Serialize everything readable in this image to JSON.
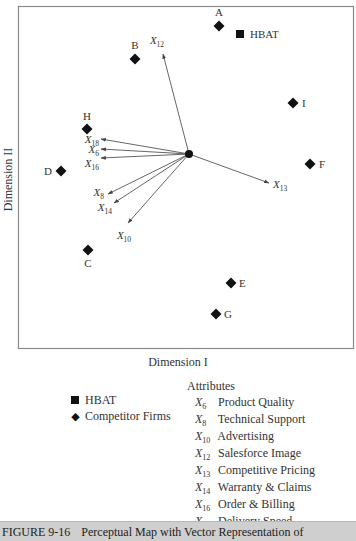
{
  "chart_data": {
    "type": "scatter",
    "title": "Perceptual Map with Vector Representation of",
    "figure_number": "FIGURE 9-16",
    "xlabel": "Dimension I",
    "ylabel": "Dimension II",
    "grid": false,
    "legend_position": "bottom",
    "origin": [
      0,
      0
    ],
    "units": "relative plot units (pixels from vector origin, y up)",
    "firms": [
      {
        "label": "HBAT",
        "marker": "square",
        "x": 51,
        "y": 120
      },
      {
        "label": "A",
        "marker": "diamond",
        "x": 30,
        "y": 128
      },
      {
        "label": "B",
        "marker": "diamond",
        "x": -54,
        "y": 95
      },
      {
        "label": "C",
        "marker": "diamond",
        "x": -101,
        "y": -96
      },
      {
        "label": "D",
        "marker": "diamond",
        "x": -128,
        "y": -17
      },
      {
        "label": "E",
        "marker": "diamond",
        "x": 42,
        "y": -129
      },
      {
        "label": "F",
        "marker": "diamond",
        "x": 121,
        "y": -10
      },
      {
        "label": "G",
        "marker": "diamond",
        "x": 27,
        "y": -160
      },
      {
        "label": "H",
        "marker": "diamond",
        "x": -102,
        "y": 25
      },
      {
        "label": "I",
        "marker": "diamond",
        "x": 104,
        "y": 51
      }
    ],
    "vectors": [
      {
        "code": "12",
        "name": "Salesforce Image",
        "x": -26,
        "y": 100
      },
      {
        "code": "18",
        "name": "Delivery Speed",
        "x": -88,
        "y": 15
      },
      {
        "code": "6",
        "name": "Product Quality",
        "x": -88,
        "y": 5
      },
      {
        "code": "16",
        "name": "Order & Billing",
        "x": -88,
        "y": -4
      },
      {
        "code": "8",
        "name": "Technical Support",
        "x": -81,
        "y": -40
      },
      {
        "code": "14",
        "name": "Warranty & Claims",
        "x": -75,
        "y": -49
      },
      {
        "code": "10",
        "name": "Advertising",
        "x": -61,
        "y": -69
      },
      {
        "code": "13",
        "name": "Competitive Pricing",
        "x": 80,
        "y": -29
      }
    ]
  },
  "axes": {
    "xlabel": "Dimension I",
    "ylabel": "Dimension II"
  },
  "legend": {
    "firms": [
      {
        "marker": "square",
        "label": "HBAT"
      },
      {
        "marker": "diamond",
        "label": "Competitor Firms"
      }
    ],
    "attributes_title": "Attributes",
    "attributes": [
      {
        "sub": "6",
        "label": "Product Quality"
      },
      {
        "sub": "8",
        "label": "Technical Support"
      },
      {
        "sub": "10",
        "label": "Advertising"
      },
      {
        "sub": "12",
        "label": "Salesforce Image"
      },
      {
        "sub": "13",
        "label": "Competitive Pricing"
      },
      {
        "sub": "14",
        "label": "Warranty & Claims"
      },
      {
        "sub": "16",
        "label": "Order & Billing"
      },
      {
        "sub": "18",
        "label": "Delivery Speed"
      }
    ]
  },
  "caption": {
    "number": "FIGURE 9-16",
    "text": "Perceptual Map with Vector Representation of"
  },
  "colors": {
    "marker": "#111111",
    "frame": "#8a8a8a",
    "vector": "#555555",
    "caption_bg": "#cfcfcf"
  }
}
